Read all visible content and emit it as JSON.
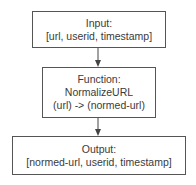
{
  "diagram": {
    "nodes": [
      {
        "id": "input",
        "lines": [
          "Input:",
          "[url, userid, timestamp]"
        ]
      },
      {
        "id": "function",
        "lines": [
          "Function:",
          "NormalizeURL",
          "(url) -> (normed-url)"
        ]
      },
      {
        "id": "output",
        "lines": [
          "Output:",
          "[normed-url, userid, timestamp]"
        ]
      }
    ],
    "edges": [
      {
        "from": "input",
        "to": "function"
      },
      {
        "from": "function",
        "to": "output"
      }
    ],
    "colors": {
      "border": "#555555",
      "text": "#3a3a3a",
      "background": "#ffffff"
    }
  }
}
